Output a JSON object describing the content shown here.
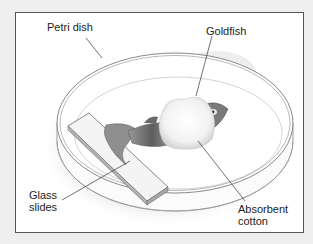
{
  "figure": {
    "labels": {
      "petri_dish": "Petri dish",
      "goldfish": "Goldfish",
      "glass_slides": "Glass\nslides",
      "absorbent_cotton": "Absorbent\ncotton"
    },
    "colors": {
      "background": "#efefef",
      "frame_border": "#555555",
      "label_text": "#222222",
      "leader_line": "#333333",
      "shadow": "#b8b8b8",
      "fish_body": "#7a7a7a"
    }
  }
}
